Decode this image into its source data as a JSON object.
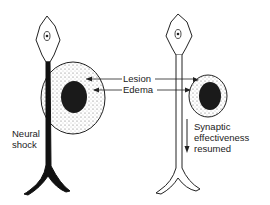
{
  "labels": {
    "lesion": "Lesion",
    "edema": "Edema",
    "neural_shock_line1": "Neural",
    "neural_shock_line2": "shock",
    "synaptic_line1": "Synaptic",
    "synaptic_line2": "effectiveness",
    "synaptic_line3": "resumed"
  },
  "colors": {
    "stroke": "#222222",
    "lesion": "#1a1a1a",
    "edema_fill": "#f2f2f2"
  }
}
